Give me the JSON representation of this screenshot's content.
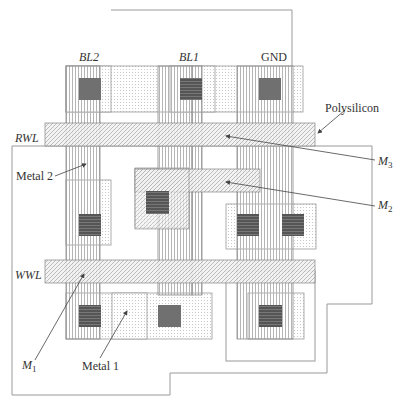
{
  "labels": {
    "bl2": "BL2",
    "bl1": "BL1",
    "gnd": "GND",
    "rwl": "RWL",
    "wwl": "WWL",
    "polysilicon": "Polysilicon",
    "metal2": "Metal 2",
    "metal1": "Metal 1",
    "m3": "M",
    "m3_sub": "3",
    "m2": "M",
    "m2_sub": "2",
    "m1": "M",
    "m1_sub": "1"
  },
  "colors": {
    "outline": "#999999",
    "contact": "#666666",
    "contact_dark": "#444444",
    "text": "#333333",
    "leader": "#555555"
  }
}
